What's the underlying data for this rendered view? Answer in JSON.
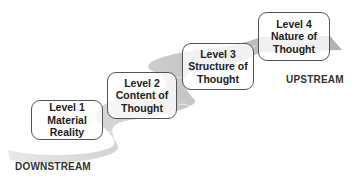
{
  "diagram": {
    "levels": [
      {
        "id": 1,
        "lines": [
          "Level 1",
          "Material",
          "Reality"
        ]
      },
      {
        "id": 2,
        "lines": [
          "Level 2",
          "Content of",
          "Thought"
        ]
      },
      {
        "id": 3,
        "lines": [
          "Level 3",
          "Structure of",
          "Thought"
        ]
      },
      {
        "id": 4,
        "lines": [
          "Level 4",
          "Nature of",
          "Thought"
        ]
      }
    ],
    "labels": {
      "downstream": "DOWNSTREAM",
      "upstream": "UPSTREAM"
    },
    "colors": {
      "stream": "#b8b8b8",
      "stream_dark": "#9a9a9a",
      "box_border": "#555555",
      "text": "#222222"
    }
  }
}
